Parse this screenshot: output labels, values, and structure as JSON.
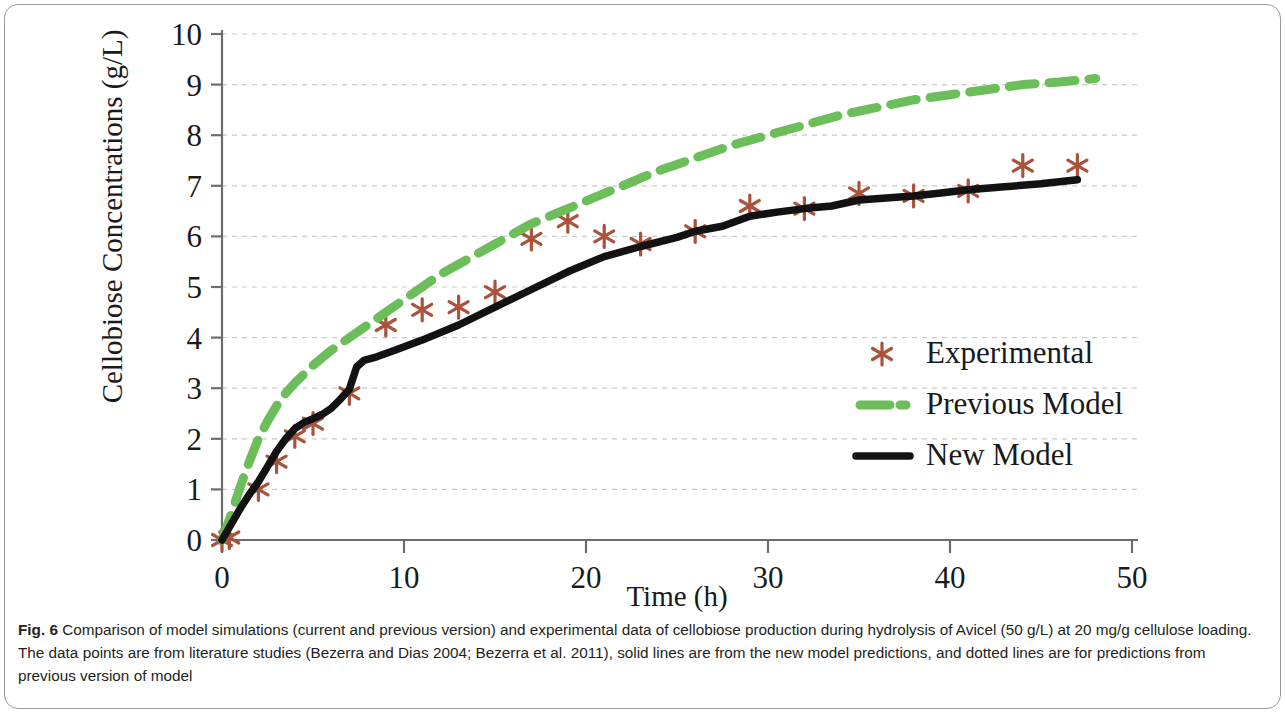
{
  "figure": {
    "label": "Fig. 6",
    "caption": "Comparison of model simulations (current and previous version) and experimental data of cellobiose production during hydrolysis of Avicel (50 g/L) at 20 mg/g cellulose loading. The data points are from literature studies (Bezerra and Dias 2004; Bezerra et al. 2011), solid lines are from the new model predictions, and dotted lines are for predictions from previous version of model"
  },
  "colors": {
    "experimental": "#a9523c",
    "previous_model": "#6cbe5a",
    "new_model": "#121212",
    "axis": "#6d6d6d",
    "grid": "#c9c9c9",
    "text": "#1a1a1a"
  },
  "chart_data": {
    "type": "scatter",
    "title": "",
    "xlabel": "Time (h)",
    "ylabel": "Cellobiose Concentrations (g/L)",
    "xlim": [
      0,
      50
    ],
    "ylim": [
      0,
      10
    ],
    "xticks": [
      0,
      10,
      20,
      30,
      40,
      50
    ],
    "yticks": [
      0,
      1,
      2,
      3,
      4,
      5,
      6,
      7,
      8,
      9,
      10
    ],
    "xtick_labels": [
      "0",
      "10",
      "20",
      "30",
      "40",
      "50"
    ],
    "ytick_labels": [
      "0",
      "1",
      "2",
      "3",
      "4",
      "5",
      "6",
      "7",
      "8",
      "9",
      "10"
    ],
    "grid": "horizontal-dashed",
    "legend_position": "center-right",
    "series": [
      {
        "name": "Experimental",
        "style": "markers",
        "marker": "asterisk",
        "color": "#a9523c",
        "points": [
          [
            0.0,
            0.0
          ],
          [
            0.4,
            0.05
          ],
          [
            2.0,
            1.0
          ],
          [
            3.0,
            1.55
          ],
          [
            4.0,
            2.05
          ],
          [
            5.0,
            2.3
          ],
          [
            7.0,
            2.9
          ],
          [
            9.0,
            4.25
          ],
          [
            11.0,
            4.55
          ],
          [
            13.0,
            4.6
          ],
          [
            15.0,
            4.9
          ],
          [
            17.0,
            5.95
          ],
          [
            19.0,
            6.3
          ],
          [
            21.0,
            6.0
          ],
          [
            23.0,
            5.85
          ],
          [
            26.0,
            6.1
          ],
          [
            29.0,
            6.6
          ],
          [
            32.0,
            6.55
          ],
          [
            35.0,
            6.85
          ],
          [
            38.0,
            6.8
          ],
          [
            41.0,
            6.9
          ],
          [
            44.0,
            7.4
          ],
          [
            47.0,
            7.4
          ]
        ]
      },
      {
        "name": "Previous Model",
        "style": "dashed-line",
        "color": "#6cbe5a",
        "points": [
          [
            0.0,
            0.0
          ],
          [
            0.5,
            0.5
          ],
          [
            1.0,
            1.05
          ],
          [
            1.5,
            1.55
          ],
          [
            2.0,
            2.0
          ],
          [
            2.5,
            2.35
          ],
          [
            3.0,
            2.65
          ],
          [
            3.5,
            2.9
          ],
          [
            4.0,
            3.1
          ],
          [
            5.0,
            3.45
          ],
          [
            6.0,
            3.75
          ],
          [
            7.0,
            4.0
          ],
          [
            8.0,
            4.25
          ],
          [
            9.0,
            4.5
          ],
          [
            10.0,
            4.75
          ],
          [
            11.0,
            5.0
          ],
          [
            12.0,
            5.25
          ],
          [
            13.0,
            5.45
          ],
          [
            14.0,
            5.65
          ],
          [
            15.0,
            5.85
          ],
          [
            16.0,
            6.05
          ],
          [
            17.0,
            6.25
          ],
          [
            18.0,
            6.4
          ],
          [
            19.0,
            6.55
          ],
          [
            20.0,
            6.7
          ],
          [
            22.0,
            7.0
          ],
          [
            24.0,
            7.3
          ],
          [
            26.0,
            7.55
          ],
          [
            28.0,
            7.8
          ],
          [
            30.0,
            8.0
          ],
          [
            32.0,
            8.2
          ],
          [
            34.0,
            8.4
          ],
          [
            36.0,
            8.55
          ],
          [
            38.0,
            8.7
          ],
          [
            40.0,
            8.8
          ],
          [
            42.0,
            8.9
          ],
          [
            44.0,
            9.0
          ],
          [
            46.0,
            9.05
          ],
          [
            48.0,
            9.12
          ]
        ]
      },
      {
        "name": "New Model",
        "style": "solid-line",
        "color": "#121212",
        "points": [
          [
            0.0,
            0.0
          ],
          [
            0.4,
            0.25
          ],
          [
            1.0,
            0.62
          ],
          [
            1.5,
            0.9
          ],
          [
            2.0,
            1.15
          ],
          [
            2.5,
            1.45
          ],
          [
            3.0,
            1.75
          ],
          [
            3.5,
            2.0
          ],
          [
            4.0,
            2.2
          ],
          [
            4.5,
            2.32
          ],
          [
            5.0,
            2.4
          ],
          [
            5.5,
            2.48
          ],
          [
            6.0,
            2.6
          ],
          [
            6.5,
            2.78
          ],
          [
            7.0,
            2.98
          ],
          [
            7.2,
            3.2
          ],
          [
            7.4,
            3.42
          ],
          [
            7.8,
            3.55
          ],
          [
            8.5,
            3.62
          ],
          [
            9.5,
            3.75
          ],
          [
            11.0,
            3.95
          ],
          [
            13.0,
            4.25
          ],
          [
            15.0,
            4.6
          ],
          [
            17.0,
            4.95
          ],
          [
            19.0,
            5.3
          ],
          [
            21.0,
            5.6
          ],
          [
            23.0,
            5.8
          ],
          [
            25.0,
            5.98
          ],
          [
            26.0,
            6.1
          ],
          [
            27.5,
            6.2
          ],
          [
            29.0,
            6.4
          ],
          [
            30.5,
            6.48
          ],
          [
            32.0,
            6.55
          ],
          [
            33.5,
            6.6
          ],
          [
            35.0,
            6.72
          ],
          [
            36.5,
            6.76
          ],
          [
            38.0,
            6.8
          ],
          [
            39.5,
            6.86
          ],
          [
            41.0,
            6.92
          ],
          [
            43.0,
            6.98
          ],
          [
            45.0,
            7.04
          ],
          [
            47.0,
            7.12
          ]
        ]
      }
    ],
    "legend": [
      {
        "label": "Experimental",
        "marker": "asterisk",
        "color": "#a9523c"
      },
      {
        "label": "Previous Model",
        "marker": "dashed-line",
        "color": "#6cbe5a"
      },
      {
        "label": "New Model",
        "marker": "solid-line",
        "color": "#121212"
      }
    ]
  }
}
